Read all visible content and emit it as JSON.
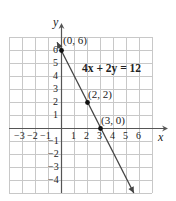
{
  "chart_data": {
    "type": "line",
    "title": "",
    "equation": "4x + 2y = 12",
    "xlabel": "x",
    "ylabel": "y",
    "xlim": [
      -4,
      7
    ],
    "ylim": [
      -5,
      7
    ],
    "grid": true,
    "x_ticks": [
      -3,
      -2,
      -1,
      1,
      2,
      3,
      4,
      5,
      6
    ],
    "y_ticks": [
      6,
      5,
      4,
      3,
      2,
      1,
      -1,
      -2,
      -3,
      -4
    ],
    "series": [
      {
        "name": "4x + 2y = 12",
        "line": {
          "slope": -2,
          "intercept": 6,
          "from": [
            -0.3,
            6.6
          ],
          "to": [
            5.6,
            -5
          ]
        },
        "points": [
          {
            "x": 0,
            "y": 6,
            "label": "(0, 6)"
          },
          {
            "x": 2,
            "y": 2,
            "label": "(2, 2)"
          },
          {
            "x": 3,
            "y": 0,
            "label": "(3, 0)"
          }
        ]
      }
    ]
  },
  "labels": {
    "x_axis": "x",
    "y_axis": "y",
    "equation": "4x + 2y = 12",
    "points": [
      "(0, 6)",
      "(2, 2)",
      "(3, 0)"
    ],
    "x_ticks": [
      "−3",
      "−2",
      "−1",
      "1",
      "2",
      "3",
      "4",
      "5",
      "6"
    ],
    "y_ticks": [
      "6",
      "5",
      "4",
      "3",
      "2",
      "1",
      "−1",
      "−2",
      "−3",
      "−4"
    ]
  },
  "colors": {
    "grid": "#c8c8c8",
    "axes": "#555555",
    "line": "#444444",
    "points": "#111111",
    "text": "#222222"
  }
}
